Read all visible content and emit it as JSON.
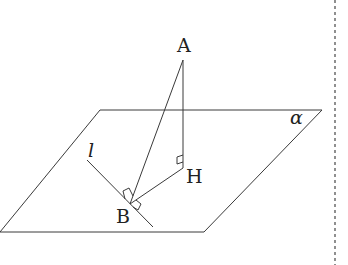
{
  "diagram": {
    "type": "3d-geometry",
    "labels": {
      "A": "A",
      "H": "H",
      "B": "B",
      "l": "l",
      "alpha": "α"
    },
    "points": {
      "A": [
        183,
        60
      ],
      "H": [
        183,
        168
      ],
      "B": [
        130,
        204
      ]
    },
    "plane": {
      "name": "α",
      "vertices": [
        [
          100,
          110
        ],
        [
          322,
          110
        ],
        [
          204,
          232
        ],
        [
          0,
          232
        ]
      ]
    },
    "line_l": {
      "from": [
        87,
        160
      ],
      "to": [
        153,
        227
      ]
    },
    "segments": [
      {
        "from": "A",
        "to": "H",
        "right_angle_at": "H"
      },
      {
        "from": "A",
        "to": "B",
        "right_angle_at": "B"
      },
      {
        "from": "H",
        "to": "B",
        "right_angle_at": "B"
      }
    ],
    "stroke_color": "#3a3a3a",
    "divider": {
      "style": "dashed",
      "x": 335
    }
  }
}
